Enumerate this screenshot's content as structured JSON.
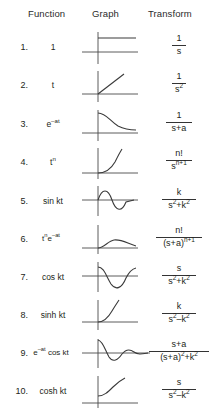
{
  "headers": {
    "index": "",
    "function": "Function",
    "graph": "Graph",
    "transform": "Transform"
  },
  "rows": [
    {
      "index": "1.",
      "function": "1",
      "function_html": "1",
      "graph_icon": "constant-step-graph",
      "transform": "1/s",
      "numerator": "1",
      "denominator": "s",
      "denominator_html": "s",
      "bar_width": "w14"
    },
    {
      "index": "2.",
      "function": "t",
      "function_html": "t",
      "graph_icon": "linear-ramp-graph",
      "transform": "1/s^2",
      "numerator": "1",
      "denominator": "s2",
      "denominator_html": "s<sup>2</sup>",
      "bar_width": "w14"
    },
    {
      "index": "3.",
      "function": "e-at",
      "function_html": "e<sup>&#8211;at</sup>",
      "graph_icon": "exponential-decay-graph",
      "transform": "1/(s+a)",
      "numerator": "1",
      "denominator": "s+a",
      "denominator_html": "s+a",
      "bar_width": "w26"
    },
    {
      "index": "4.",
      "function": "tn",
      "function_html": "t<sup>n</sup>",
      "graph_icon": "power-curve-graph",
      "transform": "n!/s^(n+1)",
      "numerator": "n!",
      "denominator": "sn+1",
      "denominator_html": "s<sup>n+1</sup>",
      "bar_width": "w26"
    },
    {
      "index": "5.",
      "function": "sin kt",
      "function_html": "sin kt",
      "graph_icon": "sine-wave-graph",
      "transform": "k/(s^2+k^2)",
      "numerator": "k",
      "denominator": "s2+k2",
      "denominator_html": "s<sup>2</sup>+k<sup>2</sup>",
      "bar_width": "w34"
    },
    {
      "index": "6.",
      "function": "tne-at",
      "function_html": "t<sup>n</sup>e<sup>&#8211;at</sup>",
      "graph_icon": "damped-power-graph",
      "transform": "n!/(s+a)^(n+1)",
      "numerator": "n!",
      "denominator": "(s+a)n+1",
      "denominator_html": "(s+a)<sup>n+1</sup>",
      "bar_width": "w46"
    },
    {
      "index": "7.",
      "function": "cos kt",
      "function_html": "cos kt",
      "graph_icon": "cosine-wave-graph",
      "transform": "s/(s^2+k^2)",
      "numerator": "s",
      "denominator": "s2+k2",
      "denominator_html": "s<sup>2</sup>+k<sup>2</sup>",
      "bar_width": "w34"
    },
    {
      "index": "8.",
      "function": "sinh kt",
      "function_html": "sinh kt",
      "graph_icon": "sinh-growth-graph",
      "transform": "k/(s^2-k^2)",
      "numerator": "k",
      "denominator": "s2-k2",
      "denominator_html": "s<sup>2</sup>&#8211;k<sup>2</sup>",
      "bar_width": "w34"
    },
    {
      "index": "9.",
      "function": "e-at cos kt",
      "function_html": "e<sup>&#8211;at</sup> cos kt",
      "graph_icon": "damped-cosine-graph",
      "transform": "(s+a)/((s+a)^2+k^2)",
      "numerator": "s+a",
      "denominator": "(s+a)2+k2",
      "denominator_html": "(s+a)<sup>2</sup>+k<sup>2</sup>",
      "bar_width": "w60"
    },
    {
      "index": "10.",
      "function": "cosh kt",
      "function_html": "cosh kt",
      "graph_icon": "cosh-growth-graph",
      "transform": "s/(s^2-k^2)",
      "numerator": "s",
      "denominator": "s2-k2",
      "denominator_html": "s<sup>2</sup>&#8211;k<sup>2</sup>",
      "bar_width": "w34"
    }
  ],
  "colors": {
    "ink": "#231f20",
    "axis": "#4a4a4a",
    "curve": "#3a3a3a",
    "background": "#ffffff"
  }
}
